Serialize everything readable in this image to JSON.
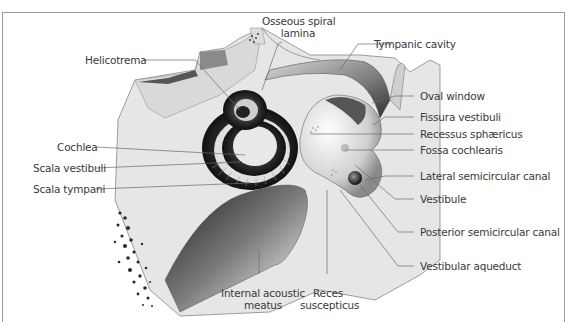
{
  "figure": {
    "labels_left": [
      {
        "id": "helicotrema",
        "text": "Helicotrema"
      },
      {
        "id": "cochlea",
        "text": "Cochlea"
      },
      {
        "id": "scala-vestibuli",
        "text": "Scala vestibuli"
      },
      {
        "id": "scala-tympani",
        "text": "Scala tympani"
      }
    ],
    "labels_top": [
      {
        "id": "osseous-spiral-lamina",
        "line1": "Osseous spiral",
        "line2": "lamina"
      },
      {
        "id": "tympanic-cavity",
        "text": "Tympanic cavity"
      }
    ],
    "labels_right": [
      {
        "id": "oval-window",
        "text": "Oval window"
      },
      {
        "id": "fissura-vestibuli",
        "text": "Fissura vestibuli"
      },
      {
        "id": "recessus-sphaericus",
        "text": "Recessus sphæricus"
      },
      {
        "id": "fossa-cochlearis",
        "text": "Fossa cochlearis"
      },
      {
        "id": "lateral-semicircular-canal",
        "text": "Lateral semicircular canal"
      },
      {
        "id": "vestibule",
        "text": "Vestibule"
      },
      {
        "id": "posterior-semicircular-canal",
        "text": "Posterior semicircular canal"
      },
      {
        "id": "vestibular-aqueduct",
        "text": "Vestibular aqueduct"
      }
    ],
    "labels_bottom": [
      {
        "id": "internal-acoustic-meatus",
        "line1": "Internal acoustic",
        "line2": "meatus"
      },
      {
        "id": "reces-suscepticus",
        "line1": "Reces",
        "line2": "suscepticus"
      }
    ],
    "colors": {
      "frame": "#9a9a9a",
      "bone": "#e4e4e4",
      "bone_light": "#efefef",
      "dark": "#2a2a2a",
      "leader": "#6a6a6a",
      "text": "#3a3a3a"
    }
  }
}
